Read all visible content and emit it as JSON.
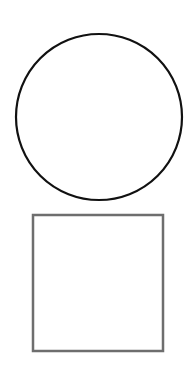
{
  "canvas": {
    "width": 189,
    "height": 367,
    "background": "#ffffff"
  },
  "shapes": [
    {
      "type": "circle",
      "cx": 99,
      "cy": 117,
      "r": 83,
      "stroke": "#111111",
      "stroke_width": 2.2,
      "fill": "none"
    },
    {
      "type": "square",
      "x": 33,
      "y": 215,
      "width": 130,
      "height": 136,
      "stroke": "#6e6e6e",
      "stroke_width": 2.5,
      "fill": "none"
    }
  ]
}
